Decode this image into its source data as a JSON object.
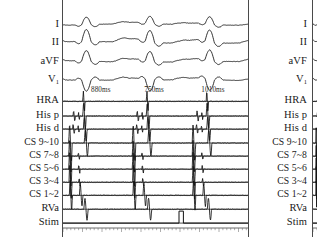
{
  "chart_data": {
    "type": "line",
    "title": "",
    "subtitle": "",
    "xlabel": "",
    "ylabel": "",
    "grid": false,
    "legend_position": "left",
    "sweep_ms_total": 2640,
    "beat_count": 3,
    "beat_x_fraction": [
      0.115,
      0.455,
      0.775
    ],
    "categories": [
      "I",
      "II",
      "aVF",
      "V1",
      "HRA",
      "His p",
      "His d",
      "CS 9~10",
      "CS 7~8",
      "CS 5~6",
      "CS 3~4",
      "CS 1~2",
      "RVa",
      "Stim"
    ],
    "annotations": [
      {
        "label": "880ms",
        "value": 880,
        "unit": "ms",
        "x_fraction": 0.155
      },
      {
        "label": "750ms",
        "value": 750,
        "unit": "ms",
        "x_fraction": 0.44
      },
      {
        "label": "1010ms",
        "value": 1010,
        "unit": "ms",
        "x_fraction": 0.745
      }
    ],
    "series": [
      {
        "name": "I",
        "type": "surface-ecg",
        "row": 0
      },
      {
        "name": "II",
        "type": "surface-ecg",
        "row": 1
      },
      {
        "name": "aVF",
        "type": "surface-ecg",
        "row": 2
      },
      {
        "name": "V1",
        "type": "surface-ecg",
        "row": 3
      },
      {
        "name": "HRA",
        "type": "intracardiac",
        "row": 4
      },
      {
        "name": "His p",
        "type": "intracardiac",
        "row": 5
      },
      {
        "name": "His d",
        "type": "intracardiac",
        "row": 6
      },
      {
        "name": "CS 9~10",
        "type": "intracardiac",
        "row": 7
      },
      {
        "name": "CS 7~8",
        "type": "intracardiac",
        "row": 8
      },
      {
        "name": "CS 5~6",
        "type": "intracardiac",
        "row": 9
      },
      {
        "name": "CS 3~4",
        "type": "intracardiac",
        "row": 10
      },
      {
        "name": "CS 1~2",
        "type": "intracardiac",
        "row": 11
      },
      {
        "name": "RVa",
        "type": "intracardiac",
        "row": 12
      },
      {
        "name": "Stim",
        "type": "stimulus",
        "row": 13,
        "pulse_x_fraction": 0.632
      }
    ]
  },
  "panels": {
    "main": {
      "channels": [
        {
          "id": "lead-i",
          "label": "I",
          "sub": "",
          "y": 31,
          "size": "lg"
        },
        {
          "id": "lead-ii",
          "label": "II",
          "sub": "",
          "y": 53,
          "size": "lg"
        },
        {
          "id": "lead-avf",
          "label": "aVF",
          "sub": "",
          "y": 76,
          "size": "lg"
        },
        {
          "id": "lead-v1",
          "label": "V",
          "sub": "1",
          "y": 98,
          "size": "lg"
        },
        {
          "id": "hra",
          "label": "HRA",
          "sub": "",
          "y": 124,
          "size": "lg"
        },
        {
          "id": "his-p",
          "label": "His p",
          "sub": "",
          "y": 142,
          "size": "lg"
        },
        {
          "id": "his-d",
          "label": "His d",
          "sub": "",
          "y": 158,
          "size": "lg"
        },
        {
          "id": "cs-9-10",
          "label": "CS 9~10",
          "sub": "",
          "y": 175,
          "size": "sm"
        },
        {
          "id": "cs-7-8",
          "label": "CS 7~8",
          "sub": "",
          "y": 191,
          "size": "sm"
        },
        {
          "id": "cs-5-6",
          "label": "CS 5~6",
          "sub": "",
          "y": 207,
          "size": "sm"
        },
        {
          "id": "cs-3-4",
          "label": "CS 3~4",
          "sub": "",
          "y": 223,
          "size": "sm"
        },
        {
          "id": "cs-1-2",
          "label": "CS 1~2",
          "sub": "",
          "y": 239,
          "size": "sm"
        },
        {
          "id": "rva",
          "label": "RVa",
          "sub": "",
          "y": 256,
          "size": "lg"
        },
        {
          "id": "stim",
          "label": "Stim",
          "sub": "",
          "y": 273,
          "size": "lg"
        }
      ]
    }
  },
  "intervals": [
    {
      "id": "interval-1",
      "text": "880ms"
    },
    {
      "id": "interval-2",
      "text": "750ms"
    },
    {
      "id": "interval-3",
      "text": "1010ms"
    }
  ],
  "colors": {
    "trace": "#111111",
    "baseline": "#3d3d3d",
    "border": "#4a4a4a",
    "background": "#ffffff",
    "text": "#1a1a1a",
    "ruler": "#6b6b6b"
  }
}
